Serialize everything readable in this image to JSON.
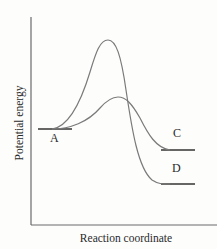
{
  "diagram": {
    "type": "reaction-energy-profile",
    "axes": {
      "y_label": "Potential energy",
      "x_label": "Reaction coordinate"
    },
    "states": [
      {
        "id": "A",
        "label": "A",
        "role": "reactant"
      },
      {
        "id": "C",
        "label": "C",
        "role": "product (higher energy, via lower barrier)"
      },
      {
        "id": "D",
        "label": "D",
        "role": "product (lower energy, via higher barrier)"
      }
    ],
    "pathways": [
      {
        "from": "A",
        "to": "D",
        "barrier": "high",
        "description": "Tall peak, ends at lower energy level D"
      },
      {
        "from": "A",
        "to": "C",
        "barrier": "low",
        "description": "Short peak, ends at higher energy level C"
      }
    ],
    "colors": {
      "curve": "#7a7a7a",
      "axis": "#6a6a6a",
      "level_line": "#333333",
      "text": "#2a2a2a"
    }
  }
}
